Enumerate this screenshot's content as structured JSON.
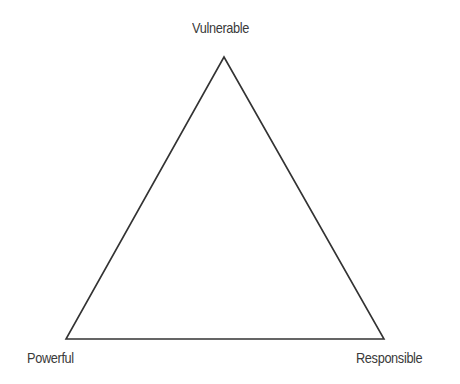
{
  "diagram": {
    "type": "triangle",
    "stroke_color": "#333333",
    "background": "#ffffff",
    "vertices": {
      "top": {
        "label": "Vulnerable",
        "x": 224,
        "y": 57
      },
      "bottom_left": {
        "label": "Powerful",
        "x": 66,
        "y": 339
      },
      "bottom_right": {
        "label": "Responsible",
        "x": 384,
        "y": 339
      }
    }
  }
}
